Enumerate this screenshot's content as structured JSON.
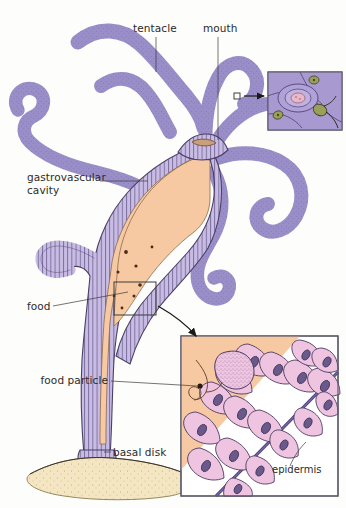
{
  "figure": {
    "background_color": "#fdfdfb"
  },
  "labels": {
    "tentacle": "tentacle",
    "mouth": "mouth",
    "gastrovascular_cavity_line1": "gastrovascular",
    "gastrovascular_cavity_line2": "cavity",
    "food": "food",
    "basal_disk": "basal disk",
    "food_particle": "food particle",
    "epidermis": "epidermis"
  },
  "colors": {
    "tentacle_fill": "#9a8ec9",
    "tentacle_outline": "#3c3356",
    "body_wall_fill": "#c9bce4",
    "body_wall_outline": "#4a3f68",
    "cavity_fill": "#f7c9a2",
    "cavity_outline": "#8a6a4e",
    "inset_cell_fill": "#eec4e0",
    "inset_cell_outline": "#4a3a5e",
    "nucleus_fill": "#6a5a8c",
    "mesoglea_line": "#4a3f78",
    "substrate_fill": "#f4e6c2",
    "substrate_outline": "#7a6a44",
    "nematocyst_capsule": "#9aa05a",
    "inset_border": "#5a5a6a",
    "label_text": "#2b2b2b",
    "leader_line": "#3a3a3a",
    "food_particle_dot": "#4a2a18"
  },
  "insets": {
    "nematocyst": {
      "name": "cnidocyte detail",
      "x": 268,
      "y": 72,
      "width": 74,
      "height": 58
    },
    "epidermis_detail": {
      "name": "body wall cellular detail",
      "x": 181,
      "y": 336,
      "width": 157,
      "height": 160
    }
  },
  "callouts": {
    "tentacle_marker": {
      "x": 237,
      "y": 96
    },
    "body_wall_box": {
      "x": 114,
      "y": 282,
      "width": 42,
      "height": 33
    }
  }
}
